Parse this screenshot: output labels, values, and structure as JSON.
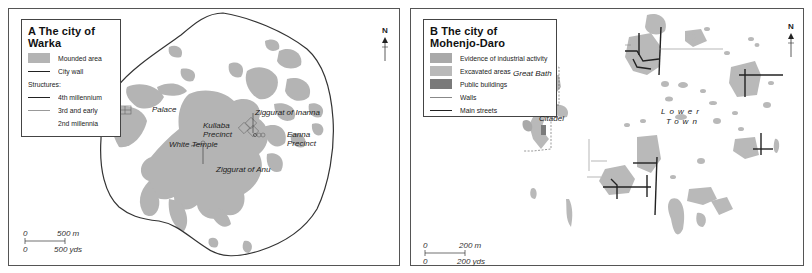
{
  "panel_a": {
    "legend": {
      "title": "A The city of Warka",
      "items": [
        {
          "type": "swatch",
          "label": "Mounded area",
          "color": "#b4b4b4"
        },
        {
          "type": "line",
          "label": "City wall",
          "color": "#222222"
        }
      ],
      "structures_heading": "Structures:",
      "structures": [
        {
          "type": "line",
          "label": "4th millennium",
          "color": "#222222"
        },
        {
          "type": "line",
          "label": "3rd and early",
          "color": "#888888"
        },
        {
          "type": "text",
          "label": "2nd millennia"
        }
      ]
    },
    "labels": {
      "palace": "Palace",
      "kullaba_1": "Kullaba",
      "kullaba_2": "Precinct",
      "white_temple": "White Temple",
      "ziggurat_anu": "Ziggurat of Anu",
      "ziggurat_inanna": "Ziggurat of Inanna",
      "eanna_1": "Eanna",
      "eanna_2": "Precinct"
    },
    "scale": {
      "top_zero": "0",
      "top_value": "500 m",
      "bottom_zero": "0",
      "bottom_value": "500 yds"
    },
    "north": "N"
  },
  "panel_b": {
    "legend": {
      "title": "B The city of Mohenjo-Daro",
      "items": [
        {
          "type": "swatch",
          "label": "Evidence of industrial activity",
          "color": "#a9a9a9"
        },
        {
          "type": "swatch",
          "label": "Excavated areas",
          "color": "#b9b9b9"
        },
        {
          "type": "swatch",
          "label": "Public buildings",
          "color": "#7a7a7a"
        },
        {
          "type": "line",
          "label": "Walls",
          "color": "#777777"
        },
        {
          "type": "line",
          "label": "Main streets",
          "color": "#222222"
        }
      ]
    },
    "labels": {
      "great_bath": "Great Bath",
      "citadel": "Citadel",
      "lower": "Lower",
      "town": "Town"
    },
    "scale": {
      "top_zero": "0",
      "top_value": "200 m",
      "bottom_zero": "0",
      "bottom_value": "200 yds"
    },
    "north": "N"
  },
  "colors": {
    "mound": "#b4b4b4",
    "public": "#7a7a7a",
    "wall": "#333333",
    "frame": "#555555"
  }
}
